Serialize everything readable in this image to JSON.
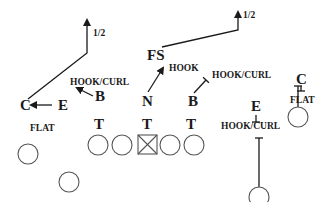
{
  "diagram": {
    "title": "",
    "colors": {
      "ink": "#1a1a1a",
      "player_outline": "#555555",
      "background": "#ffffff"
    },
    "defenders": [
      {
        "id": "C_left",
        "label": "C",
        "x": 20,
        "y": 110,
        "size": "big"
      },
      {
        "id": "E_left",
        "label": "E",
        "x": 58,
        "y": 110,
        "size": "big"
      },
      {
        "id": "B_left",
        "label": "B",
        "x": 95,
        "y": 101,
        "size": "big"
      },
      {
        "id": "FS",
        "label": "FS",
        "x": 147,
        "y": 60,
        "size": "big"
      },
      {
        "id": "N",
        "label": "N",
        "x": 142,
        "y": 106,
        "size": "big"
      },
      {
        "id": "B_right",
        "label": "B",
        "x": 188,
        "y": 106,
        "size": "big"
      },
      {
        "id": "T1",
        "label": "T",
        "x": 94,
        "y": 129,
        "size": "big"
      },
      {
        "id": "T2",
        "label": "T",
        "x": 142,
        "y": 129,
        "size": "big"
      },
      {
        "id": "T3",
        "label": "T",
        "x": 186,
        "y": 129,
        "size": "big"
      },
      {
        "id": "E_right",
        "label": "E",
        "x": 251,
        "y": 111,
        "size": "big"
      },
      {
        "id": "C_right",
        "label": "C",
        "x": 296,
        "y": 84,
        "size": "big"
      }
    ],
    "assignments": [
      {
        "text": "1/2",
        "x": 93,
        "y": 36
      },
      {
        "text": "1/2",
        "x": 243,
        "y": 18
      },
      {
        "text": "HOOK/CURL",
        "x": 70,
        "y": 85
      },
      {
        "text": "HOOK",
        "x": 169,
        "y": 71
      },
      {
        "text": "HOOK/CURL",
        "x": 212,
        "y": 78
      },
      {
        "text": "FLAT",
        "x": 30,
        "y": 131
      },
      {
        "text": "FLAT",
        "x": 290,
        "y": 103
      },
      {
        "text": "HOOK/CURL",
        "x": 221,
        "y": 129
      }
    ],
    "offense": {
      "center": {
        "label": "center-box",
        "x": 138,
        "y": 135,
        "size": 19
      },
      "linemen": [
        {
          "x": 98,
          "y": 145,
          "r": 10
        },
        {
          "x": 122,
          "y": 145,
          "r": 10
        },
        {
          "x": 170,
          "y": 145,
          "r": 10
        },
        {
          "x": 194,
          "y": 145,
          "r": 10
        }
      ],
      "skill_players": [
        {
          "x": 28,
          "y": 154,
          "r": 10
        },
        {
          "x": 69,
          "y": 182,
          "r": 10
        },
        {
          "x": 298,
          "y": 117,
          "r": 10
        },
        {
          "x": 259,
          "y": 197,
          "r": 10
        }
      ]
    },
    "routes": [
      {
        "name": "c-left-deep-half",
        "d": "M28 99 L87 53 L87 20",
        "arrow": true
      },
      {
        "name": "e-left-flat",
        "d": "M52 105 L31 105",
        "arrow": true
      },
      {
        "name": "b-left-hook-curl",
        "d": "M93 96 L77 88",
        "arrow": true
      },
      {
        "name": "fs-deep-half",
        "d": "M162 47 L238 30 L238 12",
        "arrow": true
      },
      {
        "name": "n-hook",
        "d": "M148 92 L163 68",
        "arrow": true
      },
      {
        "name": "b-right-hook-curl",
        "d": "M194 93 L206 80",
        "arrow": false,
        "tbar": true
      },
      {
        "name": "e-right-hook-curl",
        "d": "M256 115 L256 122",
        "arrow": false,
        "tbar": true
      },
      {
        "name": "c-right-flat",
        "d": "M301 86 L301 91",
        "arrow": false,
        "tbar": true
      },
      {
        "name": "wr-right-stem",
        "d": "M298 107 L298 86",
        "arrow": false,
        "tbar_top": true
      },
      {
        "name": "wr-slot-stem",
        "d": "M259 187 L259 138",
        "arrow": false,
        "tbar_top": true
      }
    ]
  }
}
